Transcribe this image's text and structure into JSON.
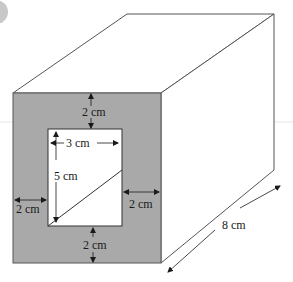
{
  "figure": {
    "colors": {
      "front_face": "#a9a9a9",
      "hole": "#ffffff",
      "edges": "#555555",
      "arrows": "#1a1a1a",
      "guide_line": "#e6e6e6",
      "corner_badge": "#c8c8c8"
    }
  },
  "labels": {
    "top_border": "2 cm",
    "hole_width": "3 cm",
    "hole_height": "5 cm",
    "left_border": "2 cm",
    "right_border": "2 cm",
    "bottom_border": "2 cm",
    "depth": "8 cm"
  }
}
